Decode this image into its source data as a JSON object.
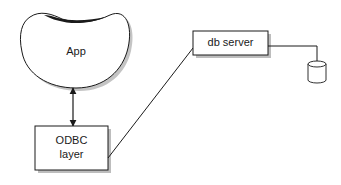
{
  "diagram": {
    "nodes": [
      {
        "id": "app",
        "label": "App",
        "shape": "blob"
      },
      {
        "id": "odbc",
        "label_line1": "ODBC",
        "label_line2": "layer",
        "shape": "box"
      },
      {
        "id": "db_server",
        "label": "db server",
        "shape": "box"
      },
      {
        "id": "database",
        "label": "",
        "shape": "cylinder"
      }
    ],
    "edges": [
      {
        "from": "app",
        "to": "odbc",
        "type": "bidirectional-arrow"
      },
      {
        "from": "odbc",
        "to": "db_server",
        "type": "line"
      },
      {
        "from": "db_server",
        "to": "database",
        "type": "elbow-line"
      }
    ],
    "colors": {
      "stroke": "#1a1a1a",
      "shadow": "#b8b8b8",
      "background": "#ffffff"
    }
  }
}
